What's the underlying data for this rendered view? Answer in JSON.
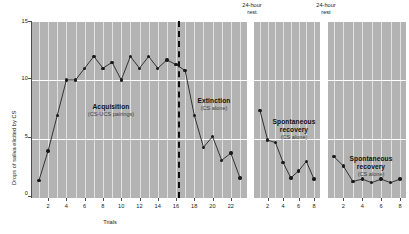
{
  "chart_data": {
    "type": "line",
    "title": "",
    "xlabel": "Trials",
    "ylabel": "Drops of saliva elicited by CS",
    "ylim": [
      0,
      15
    ],
    "yticks": [
      0,
      5,
      10,
      15
    ],
    "grid": true,
    "legend": "none",
    "panels": [
      {
        "name": "acquisition-extinction",
        "xlabel": "Trials",
        "xticks": [
          2,
          4,
          6,
          8,
          10,
          12,
          14,
          16,
          18,
          20,
          22
        ],
        "xlim": [
          1,
          23
        ],
        "x": [
          1,
          2,
          3,
          4,
          5,
          6,
          7,
          8,
          9,
          10,
          11,
          12,
          13,
          14,
          15,
          16,
          17,
          18,
          19,
          20,
          21,
          22,
          23
        ],
        "values": [
          1.5,
          4.0,
          7.0,
          10.0,
          10.0,
          11.0,
          12.0,
          11.0,
          11.5,
          10.0,
          12.0,
          11.0,
          12.0,
          11.0,
          11.7,
          11.3,
          10.8,
          7.0,
          4.3,
          5.2,
          3.2,
          3.8,
          1.7
        ],
        "annotations": [
          {
            "name": "acquisition-label",
            "title": "Acquisition",
            "subtitle": "(CS-UCS pairings)"
          },
          {
            "name": "extinction-label",
            "title": "Extinction",
            "subtitle": "(CS alone)"
          }
        ],
        "divider_after_trial": 16
      },
      {
        "name": "spontaneous-recovery-1",
        "xticks": [
          2,
          4,
          6,
          8
        ],
        "xlim": [
          1,
          8
        ],
        "x": [
          1,
          2,
          3,
          4,
          5,
          6,
          7,
          8
        ],
        "values": [
          7.4,
          4.9,
          4.7,
          3.0,
          1.7,
          2.3,
          3.1,
          1.6
        ],
        "annotations": [
          {
            "name": "spontaneous-recovery-label-1",
            "title": "Spontaneous recovery",
            "subtitle": "(CS alone)"
          }
        ]
      },
      {
        "name": "spontaneous-recovery-2",
        "xticks": [
          2,
          4,
          6,
          8
        ],
        "xlim": [
          1,
          8
        ],
        "x": [
          1,
          2,
          3,
          4,
          5,
          6,
          7,
          8
        ],
        "values": [
          3.5,
          2.7,
          1.4,
          1.6,
          1.3,
          1.6,
          1.3,
          1.6
        ],
        "annotations": [
          {
            "name": "spontaneous-recovery-label-2",
            "title": "Spontaneous recovery",
            "subtitle": "(CS alone)"
          }
        ]
      }
    ],
    "rest_labels": [
      "24-hour rest",
      "24-hour rest"
    ],
    "colors": {
      "plot_background": "#b3b3b3",
      "grid_line": "#ffffff",
      "marker": "#1a1a1a",
      "line": "#333333",
      "divider": "#111111",
      "text": "#1a1a1a"
    }
  },
  "labels": {
    "y_axis_title": "Drops of saliva elicited by CS",
    "x_axis_title": "Trials",
    "yticks": [
      "0",
      "5",
      "10",
      "15"
    ],
    "rest_line1": "24-hour",
    "rest_line2": "rest",
    "acquisition_title": "Acquisition",
    "acquisition_sub": "(CS-UCS pairings)",
    "extinction_title": "Extinction",
    "extinction_sub": "(CS alone)",
    "recovery_title_l1": "Spontaneous",
    "recovery_title_l2": "recovery",
    "recovery_sub": "(CS alone)"
  }
}
